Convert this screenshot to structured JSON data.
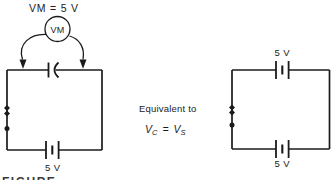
{
  "colors": {
    "ink": "#1b1b1b",
    "background": "#ffffff"
  },
  "left_circuit": {
    "meter_reading": "VM = 5 V",
    "meter_label": "VM",
    "battery_label": "5 V"
  },
  "note": {
    "line1": "Equivalent to",
    "equation": {
      "v_c_base": "V",
      "v_c_sub": "C",
      "equals": "=",
      "v_s_base": "V",
      "v_s_sub": "S"
    }
  },
  "right_circuit": {
    "top_battery_label": "5 V",
    "bottom_battery_label": "5 V"
  },
  "caption": {
    "partial_text": "FIGURE"
  }
}
